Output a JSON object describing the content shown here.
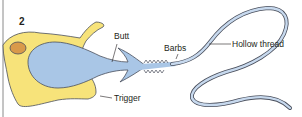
{
  "figure": {
    "panel_number": "2",
    "labels": {
      "butt": "Butt",
      "barbs": "Barbs",
      "hollow_thread": "Hollow thread",
      "trigger": "Trigger"
    },
    "colors": {
      "cell_body": "#f7e37a",
      "nucleus": "#d99a4a",
      "capsule": "#a9c6e6",
      "outline": "#4a4f5c",
      "text": "#231f20"
    }
  }
}
